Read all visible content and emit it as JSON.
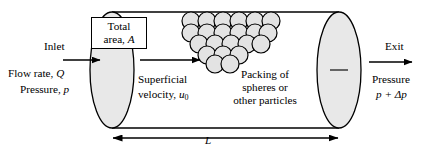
{
  "figure": {
    "name": "packed-bed-cylinder-diagram",
    "colors": {
      "stroke": "#000000",
      "fill_gray": "#e8e8e8",
      "sphere_fill": "#e3e3e3",
      "background": "#ffffff"
    }
  },
  "labels": {
    "inlet": "Inlet",
    "flow_rate": "Flow rate,",
    "flow_rate_symbol": "Q",
    "pressure_in": "Pressure,",
    "pressure_in_symbol": "p",
    "total_area_line1": "Total",
    "total_area_line2": "area,",
    "total_area_symbol": "A",
    "superficial": "Superficial",
    "velocity": "velocity,",
    "velocity_symbol": "u",
    "velocity_subscript": "0",
    "packing_line1": "Packing of",
    "packing_line2": "spheres or",
    "packing_line3": "other particles",
    "exit": "Exit",
    "pressure_out": "Pressure",
    "pressure_out_symbol": "p + Δp",
    "length_symbol": "L"
  },
  "geometry": {
    "cylinder_top_y": 12,
    "cylinder_bottom_y": 128,
    "left_ellipse_cx": 112,
    "left_ellipse_cy": 70,
    "left_ellipse_rx": 22,
    "left_ellipse_ry": 58,
    "right_ellipse_cx": 339,
    "right_ellipse_cy": 70,
    "right_ellipse_rx": 22,
    "right_ellipse_ry": 58,
    "dimension_line_y": 138,
    "dimension_x_start": 112,
    "dimension_x_end": 339
  },
  "arrows": {
    "inlet_arrow": "right-arrow-inlet",
    "superficial_arrow": "right-arrow-superficial",
    "exit_arrow": "right-arrow-exit",
    "length_arrow": "double-headed-arrow-length"
  }
}
